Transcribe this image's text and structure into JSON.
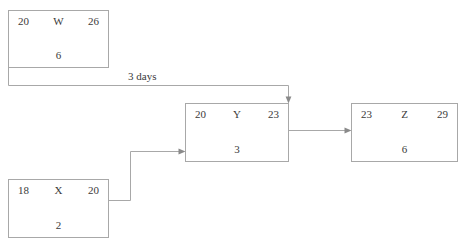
{
  "diagram": {
    "line_color": "#a8a8a8",
    "arrow_color": "#8a8a8a",
    "text_color": "#3a3a3a",
    "background": "#ffffff"
  },
  "nodes": [
    {
      "id": "W",
      "label": "W",
      "early_start": "20",
      "early_finish": "26",
      "duration": "6"
    },
    {
      "id": "X",
      "label": "X",
      "early_start": "18",
      "early_finish": "20",
      "duration": "2"
    },
    {
      "id": "Y",
      "label": "Y",
      "early_start": "20",
      "early_finish": "23",
      "duration": "3"
    },
    {
      "id": "Z",
      "label": "Z",
      "early_start": "23",
      "early_finish": "29",
      "duration": "6"
    }
  ],
  "edges": [
    {
      "from": "W",
      "to": "Y",
      "label": "3 days"
    },
    {
      "from": "X",
      "to": "Y",
      "label": ""
    },
    {
      "from": "Y",
      "to": "Z",
      "label": ""
    }
  ]
}
